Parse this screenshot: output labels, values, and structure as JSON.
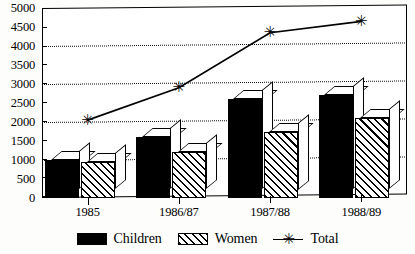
{
  "chart_data": {
    "type": "bar",
    "title": "",
    "subtitle": "",
    "xlabel": "",
    "ylabel": "",
    "categories": [
      "1985",
      "1986/87",
      "1987/88",
      "1988/89"
    ],
    "ylim": [
      0,
      5000
    ],
    "ytick_step": 500,
    "yticks": [
      0,
      500,
      1000,
      1500,
      2000,
      2500,
      3000,
      3500,
      4000,
      4500,
      5000
    ],
    "ytick_labels": [
      "0",
      "500",
      "1000",
      "1500",
      "2000",
      "2500",
      "3000",
      "3500",
      "4000",
      "4500",
      "5000"
    ],
    "gridlines": [
      1000,
      2000,
      3000,
      4000
    ],
    "grid": true,
    "legend_position": "bottom",
    "series": [
      {
        "name": "Children",
        "type": "bar",
        "style": "solid-black",
        "values": [
          1000,
          1600,
          2600,
          2700
        ]
      },
      {
        "name": "Women",
        "type": "bar",
        "style": "diagonal-hatch",
        "values": [
          950,
          1200,
          1750,
          2100
        ]
      },
      {
        "name": "Total",
        "type": "line",
        "marker": "asterisk",
        "values": [
          2050,
          2900,
          4350,
          4650
        ]
      }
    ]
  },
  "axes": {
    "y": {
      "labels": [
        "5000",
        "4500",
        "4000",
        "3500",
        "3000",
        "2500",
        "2000",
        "1500",
        "1000",
        "500",
        "0"
      ]
    },
    "x": {
      "labels": [
        "1985",
        "1986/87",
        "1987/88",
        "1988/89"
      ]
    }
  },
  "legend": {
    "items": [
      {
        "label": "Children",
        "swatch": "solid-black-swatch"
      },
      {
        "label": "Women",
        "swatch": "hatched-swatch"
      },
      {
        "label": "Total",
        "swatch": "line-asterisk-swatch",
        "marker_glyph": "✳"
      }
    ]
  },
  "colors": {
    "ink": "#000000",
    "paper": "#ffffff"
  }
}
